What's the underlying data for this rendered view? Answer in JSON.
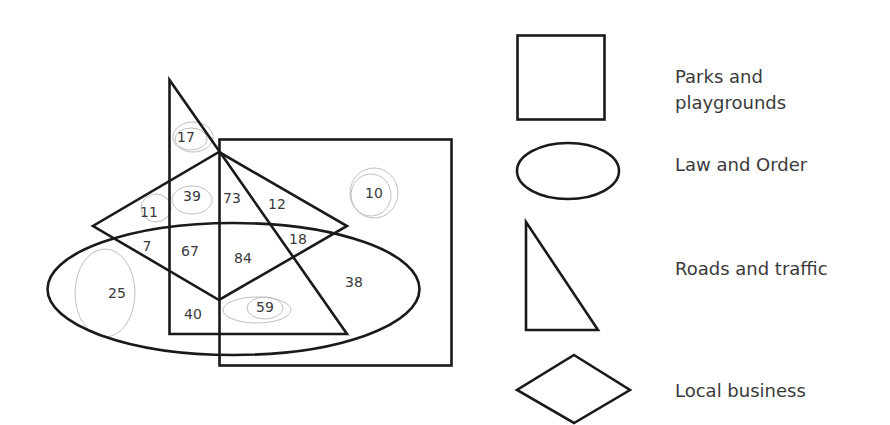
{
  "diagram": {
    "type": "venn",
    "sets": [
      {
        "id": "parks",
        "shape": "square",
        "label": "Parks and playgrounds",
        "label_line1": "Parks and",
        "label_line2": "playgrounds"
      },
      {
        "id": "law",
        "shape": "ellipse",
        "label": "Law and Order"
      },
      {
        "id": "roads",
        "shape": "right-triangle",
        "label": "Roads and traffic"
      },
      {
        "id": "business",
        "shape": "diamond",
        "label": "Local business"
      }
    ],
    "regions": [
      {
        "id": "r17",
        "value": "17",
        "sets": [
          "roads"
        ]
      },
      {
        "id": "r11",
        "value": "11",
        "sets": [
          "business"
        ]
      },
      {
        "id": "r39",
        "value": "39",
        "sets": [
          "roads",
          "business"
        ]
      },
      {
        "id": "r73",
        "value": "73",
        "sets": [
          "roads",
          "business",
          "parks"
        ]
      },
      {
        "id": "r12",
        "value": "12",
        "sets": [
          "business",
          "parks"
        ]
      },
      {
        "id": "r10",
        "value": "10",
        "sets": [
          "parks"
        ]
      },
      {
        "id": "r7",
        "value": "7",
        "sets": [
          "business",
          "law"
        ]
      },
      {
        "id": "r67",
        "value": "67",
        "sets": [
          "roads",
          "business",
          "law"
        ]
      },
      {
        "id": "r84",
        "value": "84",
        "sets": [
          "roads",
          "business",
          "law",
          "parks"
        ]
      },
      {
        "id": "r18",
        "value": "18",
        "sets": [
          "business",
          "law",
          "parks"
        ]
      },
      {
        "id": "r25",
        "value": "25",
        "sets": [
          "law"
        ]
      },
      {
        "id": "r38",
        "value": "38",
        "sets": [
          "law",
          "parks"
        ]
      },
      {
        "id": "r40",
        "value": "40",
        "sets": [
          "roads",
          "law"
        ]
      },
      {
        "id": "r59",
        "value": "59",
        "sets": [
          "roads",
          "law",
          "parks"
        ]
      }
    ]
  },
  "legend": {
    "items": [
      {
        "shape": "square",
        "line1": "Parks and",
        "line2": "playgrounds"
      },
      {
        "shape": "ellipse",
        "text": "Law and Order"
      },
      {
        "shape": "right-triangle",
        "text": "Roads and traffic"
      },
      {
        "shape": "diamond",
        "text": "Local business"
      }
    ]
  }
}
